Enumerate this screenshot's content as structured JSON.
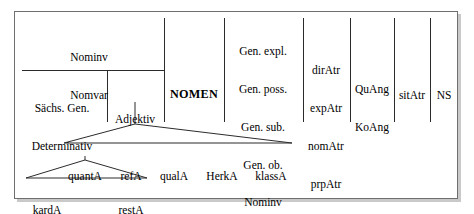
{
  "diagram": {
    "head": {
      "label": "NOMEN",
      "x": 194,
      "y": 70
    },
    "upper_left_cell": {
      "lines": [
        "Nominv",
        "Nomvar"
      ],
      "x": 89,
      "y": 38
    },
    "lower_left_cell": {
      "lines": [
        "Sächs. Gen.",
        "Determinativ"
      ],
      "x": 62,
      "y": 90
    },
    "adjektiv_cell": {
      "lines": [
        "Adjektiv"
      ],
      "x": 135,
      "y": 95
    },
    "columns": [
      {
        "name": "genitiv-column",
        "lines": [
          "Gen. expl.",
          "Gen. poss.",
          "Gen. sub.",
          "Gen. ob.",
          "Nominv",
          "Nomvar"
        ],
        "x": 263,
        "y": 27
      },
      {
        "name": "atr-column",
        "lines": [
          "dirAtr",
          "expAtr",
          "nomAtr",
          "prpAtr"
        ],
        "x": 326,
        "y": 46
      },
      {
        "name": "ang-column",
        "lines": [
          "QuAng",
          "KoAng"
        ],
        "x": 372,
        "y": 65
      },
      {
        "name": "sitatr-column",
        "lines": [
          "sitAtr"
        ],
        "x": 412,
        "y": 71
      },
      {
        "name": "ns-column",
        "lines": [
          "NS"
        ],
        "x": 444,
        "y": 71
      }
    ],
    "tree": {
      "level1": [
        {
          "name": "quantA",
          "label": "quantA",
          "x": 85,
          "y": 151
        },
        {
          "name": "refA",
          "label": "refA",
          "x": 131,
          "y": 151
        },
        {
          "name": "qualA",
          "label": "qualA",
          "x": 174,
          "y": 151
        },
        {
          "name": "HerkA",
          "label": "HerkA",
          "x": 222,
          "y": 151
        },
        {
          "name": "klassA",
          "label": "klassA",
          "x": 271,
          "y": 151
        }
      ],
      "level2": [
        {
          "name": "kardA",
          "label": "kardA",
          "x": 47,
          "y": 185
        },
        {
          "name": "restA",
          "label": "restA",
          "x": 131,
          "y": 185
        }
      ]
    },
    "colors": {
      "line": "#2b2b2b",
      "border": "#6f6f6f",
      "shadow": "#c9c9c9",
      "text": "#000000",
      "background": "#ffffff"
    }
  }
}
